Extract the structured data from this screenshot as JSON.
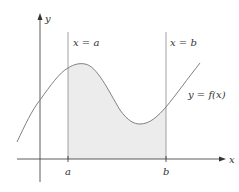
{
  "figure": {
    "type": "area-under-curve",
    "axes": {
      "x_label": "x",
      "y_label": "y"
    },
    "vertical_lines": [
      {
        "label": "x = a",
        "tick_label": "a"
      },
      {
        "label": "x = b",
        "tick_label": "b"
      }
    ],
    "curve_label": "y = f(x)",
    "colors": {
      "axis": "#333333",
      "curve": "#808080",
      "shade": "#ececec",
      "bound_line": "#8a8a8a"
    }
  }
}
